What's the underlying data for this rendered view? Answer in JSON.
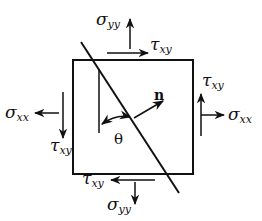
{
  "diagram": {
    "colors": {
      "ink": "#111111",
      "background": "#ffffff"
    },
    "labels": {
      "sigma_yy_top": {
        "symbol": "σ",
        "sub": "yy"
      },
      "tau_xy_top": {
        "symbol": "τ",
        "sub": "xy"
      },
      "tau_xy_right": {
        "symbol": "τ",
        "sub": "xy"
      },
      "sigma_xx_right": {
        "symbol": "σ",
        "sub": "xx"
      },
      "sigma_xx_left": {
        "symbol": "σ",
        "sub": "xx"
      },
      "tau_xy_left": {
        "symbol": "τ",
        "sub": "xy"
      },
      "tau_xy_bottom": {
        "symbol": "τ",
        "sub": "xy"
      },
      "sigma_yy_bottom": {
        "symbol": "σ",
        "sub": "yy"
      },
      "normal": "n",
      "angle": "θ"
    }
  }
}
